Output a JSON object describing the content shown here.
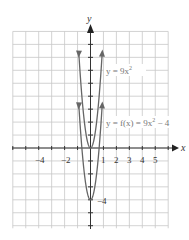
{
  "chart_data": {
    "type": "line",
    "title": "",
    "xlabel": "x",
    "ylabel": "y",
    "xlim": [
      -6,
      6
    ],
    "ylim": [
      -6,
      9
    ],
    "grid": true,
    "x_ticks": [
      -4,
      -2,
      1,
      2,
      3,
      4,
      5
    ],
    "x_tick_labels": [
      "−4",
      "−2",
      "1",
      "2",
      "3",
      "4",
      "5"
    ],
    "y_tick_labels": [
      {
        "value": -4,
        "label": "−4"
      }
    ],
    "series": [
      {
        "name": "y = 9x²",
        "formula": "9x^2",
        "x": [
          -0.94,
          -0.75,
          -0.5,
          -0.25,
          0,
          0.25,
          0.5,
          0.75,
          0.94
        ],
        "values": [
          7.95,
          5.06,
          2.25,
          0.56,
          0,
          0.56,
          2.25,
          5.06,
          7.95
        ],
        "color": "#666666"
      },
      {
        "name": "y = f(x) = 9x² − 4",
        "formula": "9x^2 - 4",
        "x": [
          -0.94,
          -0.75,
          -0.5,
          -0.25,
          0,
          0.25,
          0.5,
          0.75,
          0.94
        ],
        "values": [
          3.95,
          1.06,
          -1.75,
          -3.44,
          -4,
          -3.44,
          -1.75,
          1.06,
          3.95
        ],
        "color": "#666666"
      }
    ],
    "annotations": [
      {
        "text": "y = 9x²",
        "near": [
          4.5,
          5.8
        ]
      },
      {
        "text": "y = f(x) = 9x² − 4",
        "near": [
          6,
          1.8
        ]
      },
      {
        "text": "−4",
        "near": [
          0.7,
          -4
        ]
      }
    ]
  },
  "labels": {
    "x_axis": "x",
    "y_axis": "y",
    "curve1_prefix": "y = 9x",
    "curve1_exp": "2",
    "curve2_prefix": "y = f(x) = 9x",
    "curve2_exp": "2",
    "curve2_suffix": " − 4",
    "vertex_label": "−4",
    "tick_m4": "−4",
    "tick_m2": "−2",
    "tick_1": "1",
    "tick_2": "2",
    "tick_3": "3",
    "tick_4": "4",
    "tick_5": "5"
  }
}
